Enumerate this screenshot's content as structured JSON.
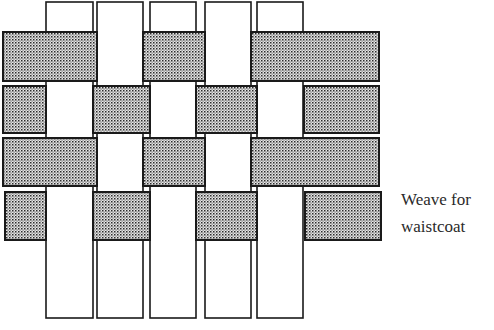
{
  "caption": {
    "line1": "Weave for",
    "line2": "waistcoat"
  },
  "colors": {
    "stroke": "#1a1a1a",
    "warp_fill": "#ffffff",
    "weft_dot": "#2b2b2b",
    "weft_bg": "#e6e6e6"
  },
  "warps": [
    {
      "x": 46,
      "w": 47,
      "y": 2,
      "h": 316
    },
    {
      "x": 97,
      "w": 46,
      "y": 2,
      "h": 316
    },
    {
      "x": 150,
      "w": 46,
      "y": 2,
      "h": 316
    },
    {
      "x": 205,
      "w": 46,
      "y": 2,
      "h": 316
    },
    {
      "x": 257,
      "w": 46,
      "y": 2,
      "h": 316
    }
  ],
  "weft_segments": [
    {
      "row": 1,
      "x": 3,
      "y": 32,
      "w": 94,
      "h": 49
    },
    {
      "row": 1,
      "x": 143,
      "y": 32,
      "w": 62,
      "h": 49
    },
    {
      "row": 1,
      "x": 251,
      "y": 32,
      "w": 128,
      "h": 49
    },
    {
      "row": 2,
      "x": 3,
      "y": 86,
      "w": 43,
      "h": 47
    },
    {
      "row": 2,
      "x": 93,
      "y": 86,
      "w": 57,
      "h": 47
    },
    {
      "row": 2,
      "x": 196,
      "y": 86,
      "w": 61,
      "h": 47
    },
    {
      "row": 2,
      "x": 304,
      "y": 86,
      "w": 75,
      "h": 47
    },
    {
      "row": 3,
      "x": 3,
      "y": 138,
      "w": 94,
      "h": 48
    },
    {
      "row": 3,
      "x": 143,
      "y": 138,
      "w": 62,
      "h": 48
    },
    {
      "row": 3,
      "x": 251,
      "y": 138,
      "w": 128,
      "h": 48
    },
    {
      "row": 4,
      "x": 5,
      "y": 192,
      "w": 41,
      "h": 48
    },
    {
      "row": 4,
      "x": 93,
      "y": 192,
      "w": 57,
      "h": 48
    },
    {
      "row": 4,
      "x": 196,
      "y": 192,
      "w": 61,
      "h": 48
    },
    {
      "row": 4,
      "x": 305,
      "y": 192,
      "w": 76,
      "h": 48
    }
  ]
}
